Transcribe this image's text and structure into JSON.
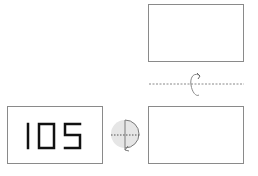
{
  "diagram": {
    "type": "rotation-puzzle",
    "source_box": {
      "label": "105"
    },
    "step1": {
      "operation": "rotate",
      "icon": "rotate-half-circle-icon",
      "description": "rotation about vertical axis (half-circle with dashed horizontal axis)"
    },
    "middle_box": {
      "label": ""
    },
    "step2": {
      "operation": "flip",
      "icon": "flip-about-horizontal-axis-icon",
      "description": "flip about dashed horizontal axis"
    },
    "result_box": {
      "label": ""
    }
  },
  "colors": {
    "border": "#8a8a8a",
    "digits": "#111111",
    "circle_fill": "#e4e4e4",
    "arrow": "#7a7a7a"
  }
}
